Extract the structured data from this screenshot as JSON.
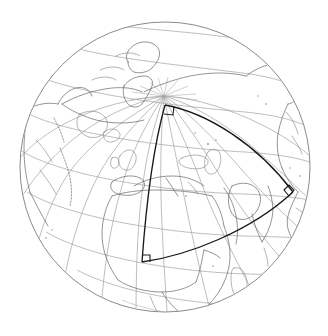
{
  "figure": {
    "type": "map",
    "projection": "orthographic",
    "background_color": "#ffffff",
    "sphere": {
      "name": "globe-disc",
      "center_x": 165,
      "center_y": 167,
      "radius": 145,
      "outline_color": "#8a8a8a",
      "outline_width": 1
    },
    "graticule": {
      "name": "lat-lon-grid",
      "color": "#9a9a9a",
      "meridian_spacing_deg": 15,
      "parallel_spacing_deg": 15,
      "pole_visible": "north",
      "pole_x": 164,
      "pole_y": 96
    },
    "coastlines": {
      "name": "world-coastlines",
      "color": "#666666",
      "regions": [
        "Europe",
        "Africa",
        "Asia",
        "North America",
        "Greenland",
        "Arabian Peninsula",
        "Mediterranean",
        "Scandinavia",
        "British Isles",
        "Madagascar",
        "Japan",
        "Iceland"
      ]
    },
    "overlay_quadrilateral": {
      "name": "spherical-quadrilateral",
      "stroke_color": "#1a1a1a",
      "stroke_width": 1.35,
      "vertices": [
        {
          "label": "north-vertex",
          "x": 165,
          "y": 105,
          "right_angle": true
        },
        {
          "label": "east-vertex",
          "x": 293,
          "y": 192,
          "right_angle": true
        },
        {
          "label": "south-vertex",
          "x": 142,
          "y": 262,
          "right_angle": true
        },
        {
          "label": "west-vertex",
          "x": 164,
          "y": 105,
          "right_angle": false
        }
      ],
      "right_angle_markers": 3,
      "edges": [
        "curved-northeast",
        "curved-south",
        "straight-west"
      ]
    }
  }
}
